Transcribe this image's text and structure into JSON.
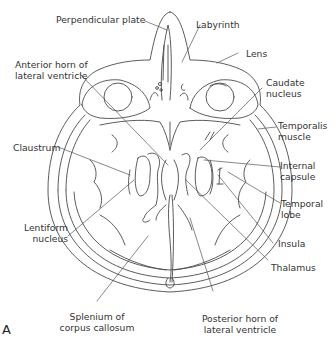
{
  "figure": {
    "panel_letter": "A",
    "view": "Axial section of head at level of lateral ventricles and orbits",
    "labels": {
      "perpendicular_plate": "Perpendicular plate",
      "labyrinth": "Labyrinth",
      "lens": "Lens",
      "anterior_horn_l1": "Anterior horn of",
      "anterior_horn_l2": "lateral ventricle",
      "caudate_l1": "Caudate",
      "caudate_l2": "nucleus",
      "temporalis_l1": "Temporalis",
      "temporalis_l2": "muscle",
      "claustrum": "Claustrum",
      "internal_capsule_l1": "Internal",
      "internal_capsule_l2": "capsule",
      "temporal_lobe_l1": "Temporal",
      "temporal_lobe_l2": "lobe",
      "lentiform_l1": "Lentiform",
      "lentiform_l2": "nucleus",
      "insula": "Insula",
      "thalamus": "Thalamus",
      "splenium_l1": "Splenium of",
      "splenium_l2": "corpus callosum",
      "posterior_horn_l1": "Posterior horn of",
      "posterior_horn_l2": "lateral ventricle"
    }
  },
  "colors": {
    "line": "#4a4a4a",
    "text": "#333333",
    "background": "#ffffff"
  }
}
